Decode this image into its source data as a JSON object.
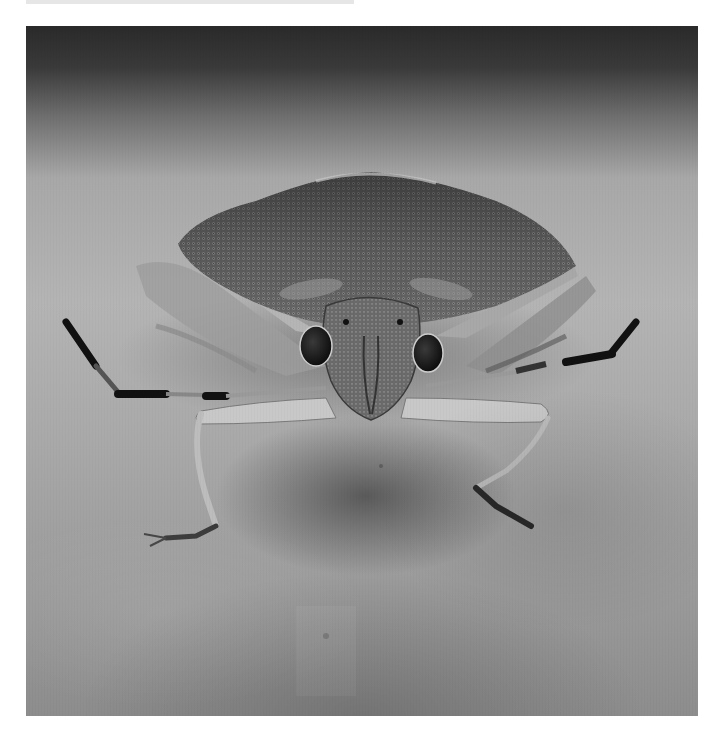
{
  "image": {
    "subject": "stink bug (shield bug) frontal macro view",
    "style": "grayscale photograph",
    "background": "blurred pale stone/leaf surface with dark band at top",
    "regions": {
      "pronotum": "textured pitted shield, wide triangular",
      "head": "narrow pitted head with two dark compound eyes",
      "legs": "thin pale legs with dark-banded antennae extending left and right",
      "shadow": "dark shadow under body"
    },
    "tones": {
      "top_band": "#2e2e2e",
      "surface": "#ababab",
      "body": "#5a5a5a",
      "eyes": "#1a1a1a",
      "antenna_bands": "#111111",
      "legs": "#c8c8c8"
    }
  }
}
